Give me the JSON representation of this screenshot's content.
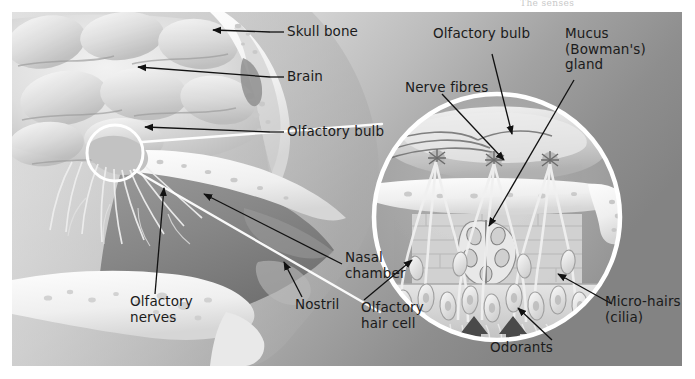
{
  "page": {
    "running_head": "The senses",
    "width": 695,
    "height": 379
  },
  "figure": {
    "background_color": "#bdbdbd",
    "label_color": "#1b1b1b",
    "callout_line_color": "#111111",
    "inset_ring_color": "#ffffff"
  },
  "labels": {
    "skull_bone": "Skull bone",
    "brain": "Brain",
    "olfactory_bulb_main": "Olfactory bulb",
    "olfactory_nerves": "Olfactory\nnerves",
    "nostril": "Nostril",
    "nasal_chamber": "Nasal\nchamber",
    "nerve_fibres": "Nerve fibres",
    "olfactory_bulb_inset": "Olfactory bulb",
    "mucus_gland": "Mucus\n(Bowman's)\ngland",
    "olfactory_hair_cell": "Olfactory\nhair cell",
    "odorants": "Odorants",
    "micro_hairs": "Micro-hairs\n(cilia)"
  }
}
